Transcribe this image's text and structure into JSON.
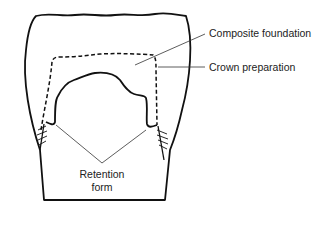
{
  "diagram": {
    "labels": {
      "composite_foundation": "Composite foundation",
      "crown_preparation": "Crown preparation",
      "retention_line1": "Retention",
      "retention_line2": "form"
    },
    "colors": {
      "stroke": "#111111",
      "leader": "#333333",
      "text": "#222222",
      "background": "#ffffff"
    }
  }
}
